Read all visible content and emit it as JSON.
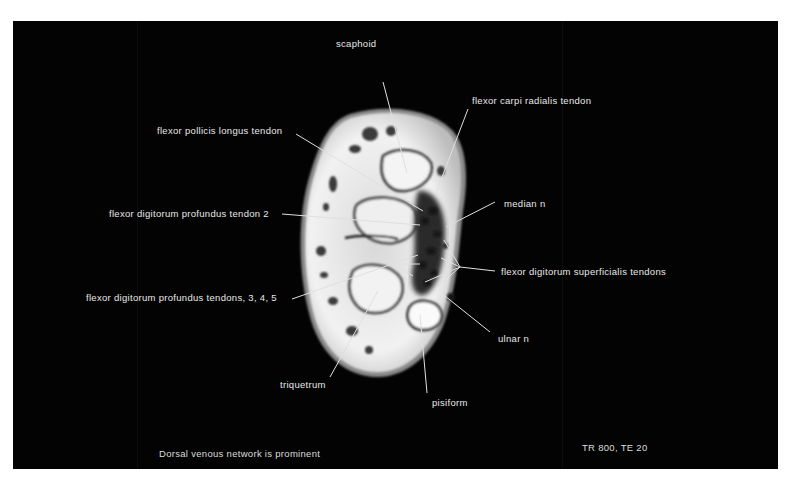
{
  "figure": {
    "frame_color": "#030303",
    "page_color": "#ffffff",
    "label_color": "#e8e8e8",
    "labels": {
      "scaphoid": "scaphoid",
      "flexor_carpi_radialis": "flexor carpi  radialis tendon",
      "flexor_pollicis_longus": "flexor pollicis  longus tendon",
      "median_n": "median n",
      "fdp_tendon_2": "flexor digitorum  profundus tendon 2",
      "fds_tendons": "flexor digitorum  superficialis tendons",
      "fdp_tendons_345": "flexor digitorum  profundus  tendons, 3, 4, 5",
      "ulnar_n": "ulnar n",
      "triquetrum": "triquetrum",
      "pisiform": "pisiform"
    },
    "caption_left": "Dorsal venous network is prominent",
    "caption_right": "TR 800,  TE 20"
  }
}
